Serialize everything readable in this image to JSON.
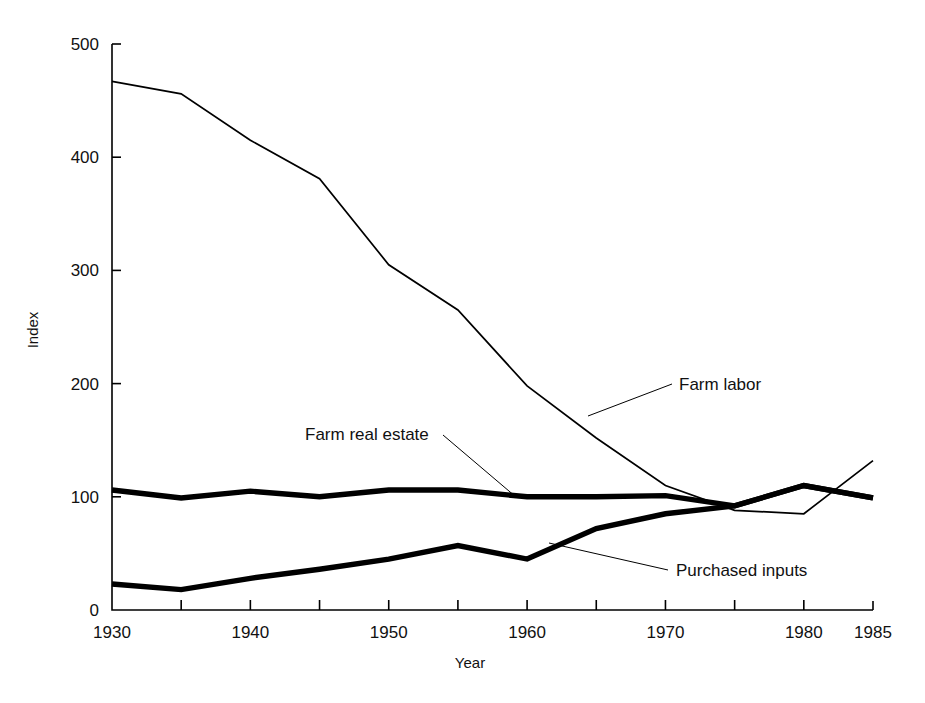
{
  "chart_data": {
    "type": "line",
    "title": "",
    "xlabel": "Year",
    "ylabel": "Index",
    "xlim": [
      1930,
      1985
    ],
    "ylim": [
      0,
      500
    ],
    "grid": false,
    "legend_position": "inline-annotations",
    "x_tick_labels": [
      "1930",
      "1940",
      "1950",
      "1960",
      "1970",
      "1980",
      "1985"
    ],
    "x_tick_values": [
      1930,
      1940,
      1950,
      1960,
      1970,
      1980,
      1985
    ],
    "x_minor_ticks": [
      1935,
      1945,
      1955,
      1965,
      1975
    ],
    "y_tick_labels": [
      "0",
      "100",
      "200",
      "300",
      "400",
      "500"
    ],
    "y_tick_values": [
      0,
      100,
      200,
      300,
      400,
      500
    ],
    "x": [
      1930,
      1935,
      1940,
      1945,
      1950,
      1955,
      1960,
      1965,
      1970,
      1975,
      1980,
      1985
    ],
    "series": [
      {
        "name": "Farm labor",
        "style": "thin",
        "values": [
          467,
          456,
          415,
          381,
          305,
          265,
          198,
          152,
          110,
          88,
          85,
          132
        ]
      },
      {
        "name": "Farm real estate",
        "style": "thick",
        "values": [
          106,
          99,
          105,
          100,
          106,
          106,
          100,
          100,
          101,
          92,
          110,
          99
        ]
      },
      {
        "name": "Purchased inputs",
        "style": "thick",
        "values": [
          23,
          18,
          28,
          36,
          45,
          57,
          45,
          72,
          85,
          92,
          110,
          99
        ]
      }
    ],
    "annotations": [
      {
        "text": "Farm labor",
        "label_x": 679,
        "label_y": 390,
        "leader": [
          [
            672,
            384
          ],
          [
            588,
            416
          ]
        ]
      },
      {
        "text": "Farm real estate",
        "label_x": 305,
        "label_y": 440,
        "leader": [
          [
            443,
            435
          ],
          [
            516,
            497
          ]
        ]
      },
      {
        "text": "Purchased inputs",
        "label_x": 676,
        "label_y": 576,
        "leader": [
          [
            668,
            570
          ],
          [
            549,
            543
          ]
        ]
      }
    ],
    "colors": {
      "line": "#000000",
      "background": "#ffffff",
      "text": "#111111"
    }
  }
}
